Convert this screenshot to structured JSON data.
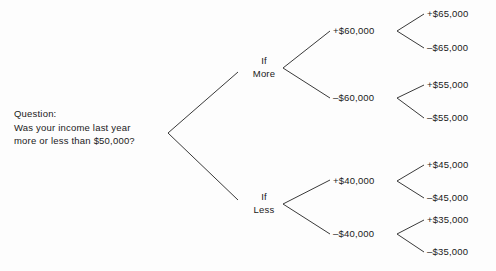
{
  "diagram": {
    "type": "decision-tree",
    "line_color": "#3a3a3a",
    "text_color": "#1a1a1a",
    "background": "#fdfdfd",
    "root": {
      "label_line1": "Question:",
      "label_line2": "Was your income last year",
      "label_line3": "more or less than $50,000?"
    },
    "level1": [
      {
        "line1": "If",
        "line2": "More"
      },
      {
        "line1": "If",
        "line2": "Less"
      }
    ],
    "level2": [
      {
        "label": "+$60,000"
      },
      {
        "label": "–$60,000"
      },
      {
        "label": "+$40,000"
      },
      {
        "label": "–$40,000"
      }
    ],
    "leaves": [
      {
        "label": "+$65,000"
      },
      {
        "label": "–$65,000"
      },
      {
        "label": "+$55,000"
      },
      {
        "label": "–$55,000"
      },
      {
        "label": "+$45,000"
      },
      {
        "label": "–$45,000"
      },
      {
        "label": "+$35,000"
      },
      {
        "label": "–$35,000"
      }
    ]
  }
}
